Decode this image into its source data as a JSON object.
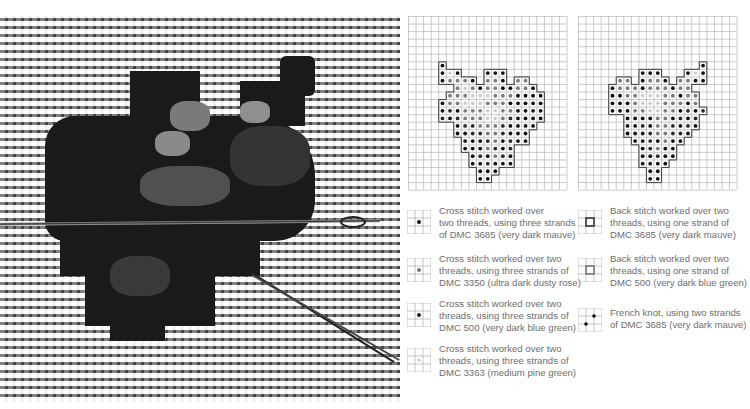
{
  "photo": {
    "alt": "Close-up photo of cross stitch embroidery on evenweave fabric with a needle passing through"
  },
  "charts": [
    {
      "name": "chart-left",
      "x": 408,
      "cols": 21,
      "rows": 23,
      "cell": 7.55,
      "pattern": [
        "",
        "",
        "",
        "",
        "",
        "",
        "....D",
        "....DPD...DDD",
        "....DRRRD.RRD.RR",
        "......RPRDRRDDRRD",
        ".....RRRPPPRRRDDDD",
        "....DRRPPPRRRDDDDD",
        "....DBDRRRPPRRDDDD",
        "....BDBRRRPPRBDDDD",
        "......DBBRRRBDDDD",
        "......DDBBRRBDDD",
        ".......DDDBRDBDD",
        ".......DDDRBDB",
        "........DBDRBD",
        "........DDBDDD",
        ".........DDD",
        ".........DD"
      ]
    },
    {
      "name": "chart-right",
      "x": 578,
      "cols": 21,
      "rows": 23,
      "cell": 7.55,
      "pattern": [
        "",
        "",
        "",
        "",
        "",
        "",
        "................D",
        "........DDD...DPD",
        ".....RR.DRRD.RRDD",
        "....DRRRDRRRDRR",
        "....DDRRPPPRRDRR",
        "....DDDRPPPRRRDR",
        "....DDDRRPPRRDBDB",
        "......DDDDRRDBDB",
        "......DDBDRRBDBD",
        "......DDDBRRBBD",
        ".......DDBDRDD",
        "........DBRDD",
        "........DDBDD",
        "........DDDD",
        ".........DD",
        ".........DD"
      ]
    }
  ],
  "legend": {
    "left": [
      {
        "symbol": "cross-3685",
        "text": "Cross stitch worked over two threads, using three strands of DMC 3685 (very dark mauve)",
        "lines": [
          "Cross stitch worked over",
          "two threads, using three strands",
          "of DMC 3685 (very dark mauve)"
        ],
        "dot_color": "#111111"
      },
      {
        "symbol": "cross-3350",
        "lines": [
          "Cross stitch worked over two",
          "threads, using three strands of",
          "DMC 3350 (ultra dark dusty rose)"
        ],
        "dot_color": "#7a7a7a"
      },
      {
        "symbol": "cross-500",
        "lines": [
          "Cross stitch worked over two",
          "threads, using three strands of",
          "DMC 500 (very dark blue green)"
        ],
        "dot_color": "#222222"
      },
      {
        "symbol": "cross-3363",
        "lines": [
          "Cross stitch worked over two",
          "threads, using three strands of",
          "DMC 3363 (medium pine green)"
        ],
        "dot_color": "#c4c4c4"
      }
    ],
    "right": [
      {
        "symbol": "back-3685",
        "lines": [
          "Back stitch worked over two",
          "threads, using one strand of",
          "DMC 3685 (very dark mauve)"
        ],
        "line_color": "#333333"
      },
      {
        "symbol": "back-500",
        "lines": [
          "Back stitch worked over two",
          "threads, using one strand of",
          "DMC 500 (very dark blue green)"
        ],
        "line_color": "#777777"
      },
      {
        "symbol": "french-knot-3685",
        "lines": [
          "French knot, using two strands",
          "of DMC 3685 (very dark mauve)"
        ],
        "dot_color": "#111111"
      }
    ]
  },
  "colors": {
    "grid_line": "#b5b5b5",
    "outline_dark": "#4a4a4a",
    "D": "#111111",
    "B": "#2a2a2a",
    "R": "#7c7c7c",
    "P": "#c8c8c8",
    "text": "#6e6e6e"
  }
}
